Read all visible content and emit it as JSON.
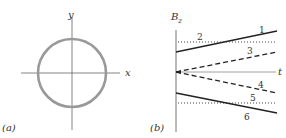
{
  "panel_a": {
    "label": "(a)",
    "x_axis_label": "x",
    "y_axis_label": "y",
    "ring_color": "#999999"
  },
  "panel_b": {
    "label": "(b)",
    "y_axis_label": "B",
    "y_axis_subscript": "z",
    "x_axis_label": "t",
    "curves": [
      {
        "id": "1",
        "style": "solid"
      },
      {
        "id": "2",
        "style": "dotted"
      },
      {
        "id": "3",
        "style": "dashed"
      },
      {
        "id": "4",
        "style": "dashed"
      },
      {
        "id": "5",
        "style": "dotted"
      },
      {
        "id": "6",
        "style": "solid"
      }
    ]
  }
}
